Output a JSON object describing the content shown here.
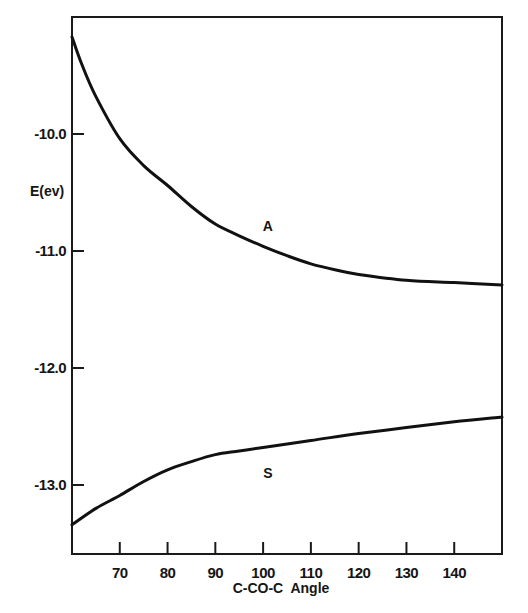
{
  "chart_data": {
    "type": "line",
    "title": "",
    "xlabel": "C-CO-C  Angle",
    "ylabel": "E(ev)",
    "xlim": [
      60,
      150
    ],
    "ylim": [
      -13.59,
      -9.0
    ],
    "x_ticks": [
      70,
      80,
      90,
      100,
      110,
      120,
      130,
      140
    ],
    "y_ticks": [
      -10.0,
      -11.0,
      -12.0,
      -13.0
    ],
    "y_tick_labels": [
      "-10.0",
      "-11.0",
      "-12.0",
      "-13.0"
    ],
    "grid": false,
    "legend": "none (inline curve labels)",
    "series": [
      {
        "name": "A",
        "x": [
          60,
          62,
          65,
          70,
          75,
          80,
          85,
          90,
          95,
          100,
          105,
          110,
          115,
          120,
          130,
          140,
          150
        ],
        "values": [
          -9.17,
          -9.4,
          -9.68,
          -10.04,
          -10.27,
          -10.44,
          -10.62,
          -10.77,
          -10.87,
          -10.96,
          -11.04,
          -11.11,
          -11.16,
          -11.2,
          -11.25,
          -11.27,
          -11.29
        ],
        "label_position": {
          "x": 101,
          "y": -10.83
        }
      },
      {
        "name": "S",
        "x": [
          60,
          65,
          70,
          75,
          80,
          85,
          90,
          95,
          100,
          110,
          120,
          130,
          140,
          150
        ],
        "values": [
          -13.34,
          -13.2,
          -13.09,
          -12.97,
          -12.87,
          -12.8,
          -12.74,
          -12.71,
          -12.68,
          -12.62,
          -12.56,
          -12.51,
          -12.46,
          -12.42
        ],
        "label_position": {
          "x": 101,
          "y": -12.94
        }
      }
    ]
  },
  "axes": {
    "x_label": "C-CO-C  Angle",
    "y_label": "E(ev)"
  }
}
